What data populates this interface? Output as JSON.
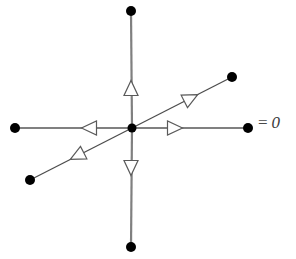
{
  "figure": {
    "background_color": "#ffffff",
    "width": 296,
    "height": 259
  },
  "label": {
    "name": "equation-label",
    "equals_sign": "=",
    "value": "0",
    "full_text": "= 0",
    "x": 258,
    "y": 114,
    "color": "#3a3a3a"
  },
  "center_node": {
    "name": "center-vertex",
    "x": 132,
    "y": 128,
    "radius": 4.5,
    "fill": "#000000"
  },
  "style": {
    "axis_line_color": "#808080",
    "axis_line_width": 2.2,
    "diagonal_line_color": "#4d4d4d",
    "diagonal_line_width": 1.3,
    "node_fill": "#000000",
    "node_radius": 5,
    "arrowhead_stroke": "#5a5a5a",
    "arrowhead_fill": "#ffffff",
    "arrowhead_length": 15,
    "arrowhead_half_width": 7
  },
  "edges": [
    {
      "name": "edge-up",
      "direction": "up",
      "from": {
        "x": 132,
        "y": 128
      },
      "to": {
        "x": 131,
        "y": 11
      },
      "line_color": "#808080",
      "line_width": 2.2,
      "arrow": {
        "x": 131,
        "y": 88,
        "angle": -90
      },
      "node": {
        "x": 131,
        "y": 11,
        "radius": 5
      }
    },
    {
      "name": "edge-down",
      "direction": "down",
      "from": {
        "x": 132,
        "y": 128
      },
      "to": {
        "x": 131,
        "y": 247
      },
      "line_color": "#808080",
      "line_width": 2.2,
      "arrow": {
        "x": 131,
        "y": 168,
        "angle": 90
      },
      "node": {
        "x": 131,
        "y": 247,
        "radius": 5
      }
    },
    {
      "name": "edge-right",
      "direction": "right",
      "from": {
        "x": 132,
        "y": 128
      },
      "to": {
        "x": 248,
        "y": 128
      },
      "line_color": "#808080",
      "line_width": 2.2,
      "arrow": {
        "x": 175,
        "y": 128,
        "angle": 0
      },
      "node": {
        "x": 248,
        "y": 128,
        "radius": 5
      }
    },
    {
      "name": "edge-left",
      "direction": "left",
      "from": {
        "x": 132,
        "y": 128
      },
      "to": {
        "x": 15,
        "y": 128
      },
      "line_color": "#808080",
      "line_width": 2.2,
      "arrow": {
        "x": 89,
        "y": 128,
        "angle": 180
      },
      "node": {
        "x": 15,
        "y": 128,
        "radius": 5
      }
    },
    {
      "name": "edge-upper-right-diagonal",
      "direction": "up-right",
      "from": {
        "x": 132,
        "y": 128
      },
      "to": {
        "x": 232,
        "y": 77
      },
      "line_color": "#4d4d4d",
      "line_width": 1.3,
      "arrow": {
        "x": 191,
        "y": 98,
        "angle": -27
      },
      "node": {
        "x": 232,
        "y": 77,
        "radius": 5
      }
    },
    {
      "name": "edge-lower-left-diagonal",
      "direction": "down-left",
      "from": {
        "x": 132,
        "y": 128
      },
      "to": {
        "x": 30,
        "y": 180
      },
      "line_color": "#4d4d4d",
      "line_width": 1.3,
      "arrow": {
        "x": 77,
        "y": 156,
        "angle": 153
      },
      "node": {
        "x": 30,
        "y": 180,
        "radius": 5
      }
    }
  ]
}
